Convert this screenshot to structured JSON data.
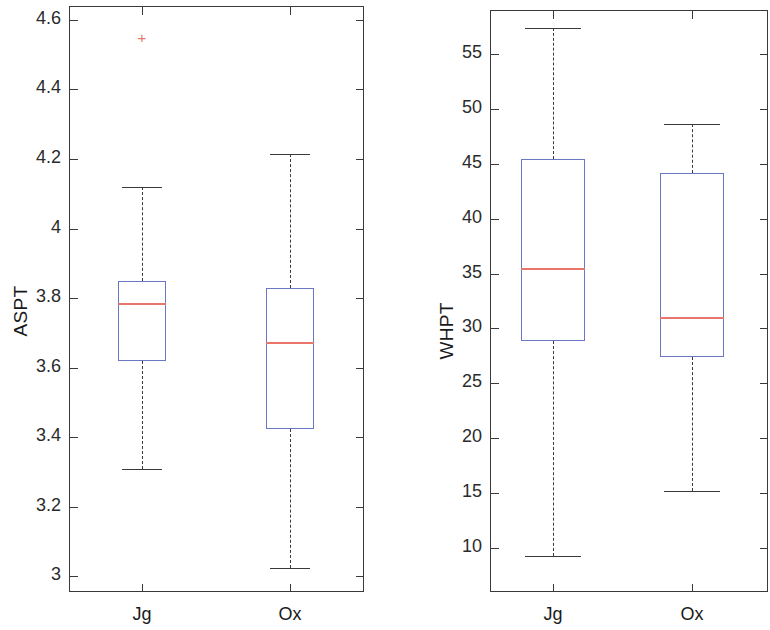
{
  "figure": {
    "kind": "boxplot-figure",
    "width": 770,
    "height": 630,
    "background": "#ffffff",
    "box_color": "#6b77c4",
    "median_color": "#e8766a",
    "outlier_color": "#e8766a",
    "axis_color": "#3a3a3a"
  },
  "chart_data": [
    {
      "type": "box",
      "panel": "left",
      "title": "",
      "xlabel": "",
      "ylabel": "ASPT",
      "categories": [
        "Jg",
        "Ox"
      ],
      "xtick_labels": [
        "Jg",
        "Ox"
      ],
      "ytick_labels": [
        "3",
        "3.2",
        "3.4",
        "3.6",
        "3.8",
        "4",
        "4.2",
        "4.4",
        "4.6"
      ],
      "yticks": [
        3,
        3.2,
        3.4,
        3.6,
        3.8,
        4,
        4.2,
        4.4,
        4.6
      ],
      "ylim": [
        2.96,
        4.64
      ],
      "grid": false,
      "legend": null,
      "boxes": [
        {
          "label": "Jg",
          "whisker_low": 3.31,
          "q1": 3.62,
          "median": 3.785,
          "q3": 3.85,
          "whisker_high": 4.12,
          "outliers": [
            4.55
          ]
        },
        {
          "label": "Ox",
          "whisker_low": 3.025,
          "q1": 3.425,
          "median": 3.675,
          "q3": 3.83,
          "whisker_high": 4.215,
          "outliers": []
        }
      ]
    },
    {
      "type": "box",
      "panel": "right",
      "title": "",
      "xlabel": "",
      "ylabel": "WHPT",
      "categories": [
        "Jg",
        "Ox"
      ],
      "xtick_labels": [
        "Jg",
        "Ox"
      ],
      "ytick_labels": [
        "10",
        "15",
        "20",
        "25",
        "30",
        "35",
        "40",
        "45",
        "50",
        "55"
      ],
      "yticks": [
        10,
        15,
        20,
        25,
        30,
        35,
        40,
        45,
        50,
        55
      ],
      "ylim": [
        6.0,
        59.0
      ],
      "grid": false,
      "legend": null,
      "boxes": [
        {
          "label": "Jg",
          "whisker_low": 9.3,
          "q1": 28.9,
          "median": 35.5,
          "q3": 45.4,
          "whisker_high": 57.4,
          "outliers": []
        },
        {
          "label": "Ox",
          "whisker_low": 15.2,
          "q1": 27.4,
          "median": 31.0,
          "q3": 44.2,
          "whisker_high": 48.6,
          "outliers": []
        }
      ]
    }
  ]
}
